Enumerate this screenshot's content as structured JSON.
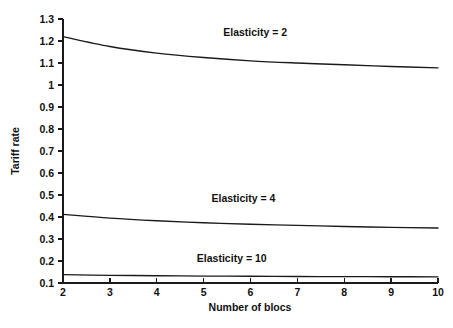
{
  "chart_data": {
    "type": "line",
    "title": "",
    "xlabel": "Number of blocs",
    "ylabel": "Tariff rate",
    "x": [
      2,
      3,
      4,
      5,
      6,
      7,
      8,
      9,
      10
    ],
    "xlim": [
      2,
      10
    ],
    "ylim": [
      0.1,
      1.3
    ],
    "xticks": [
      "2",
      "3",
      "4",
      "5",
      "6",
      "7",
      "8",
      "9",
      "10"
    ],
    "yticks": [
      "0.1",
      "0.2",
      "0.3",
      "0.4",
      "0.5",
      "0.6",
      "0.7",
      "0.8",
      "0.9",
      "1",
      "1.1",
      "1.2",
      "1.3"
    ],
    "grid": false,
    "legend_position": "inline-annotations",
    "series": [
      {
        "name": "Elasticity = 2",
        "label": "Elasticity = 2",
        "color": "#1a1a1a",
        "values": [
          1.22,
          1.175,
          1.145,
          1.125,
          1.11,
          1.1,
          1.092,
          1.084,
          1.078
        ],
        "label_x": 6.1,
        "label_y": 1.225
      },
      {
        "name": "Elasticity = 4",
        "label": "Elasticity = 4",
        "color": "#1a1a1a",
        "values": [
          0.412,
          0.395,
          0.383,
          0.374,
          0.367,
          0.362,
          0.357,
          0.353,
          0.35
        ],
        "label_x": 5.85,
        "label_y": 0.468
      },
      {
        "name": "Elasticity = 10",
        "label": "Elasticity = 10",
        "color": "#1a1a1a",
        "values": [
          0.138,
          0.135,
          0.133,
          0.1315,
          0.1305,
          0.1295,
          0.129,
          0.1285,
          0.128
        ],
        "label_x": 5.6,
        "label_y": 0.197
      }
    ]
  },
  "figure": {
    "background_color": "#ffffff",
    "axis_color": "#1a1a1a",
    "plot_left_px": 63,
    "plot_right_px": 438,
    "plot_top_px": 19,
    "plot_bottom_px": 283
  }
}
